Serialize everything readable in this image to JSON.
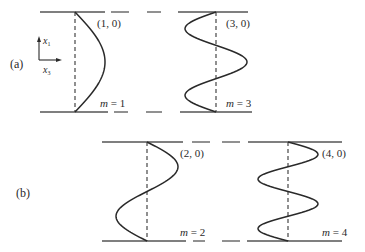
{
  "figure": {
    "colors": {
      "ink": "#2a2a2a",
      "line": "#555555"
    },
    "axes": {
      "vertical_label": "x",
      "vertical_sub": "1",
      "horizontal_label": "x",
      "horizontal_sub": "3"
    },
    "panels": [
      {
        "label": "(a)",
        "modes": [
          {
            "coord": "(1, 0)",
            "m_label": "m",
            "m_eq": " = 1",
            "m": 1
          },
          {
            "coord": "(3, 0)",
            "m_label": "m",
            "m_eq": " = 3",
            "m": 3
          }
        ]
      },
      {
        "label": "(b)",
        "modes": [
          {
            "coord": "(2, 0)",
            "m_label": "m",
            "m_eq": " = 2",
            "m": 2
          },
          {
            "coord": "(4, 0)",
            "m_label": "m",
            "m_eq": " = 4",
            "m": 4
          }
        ]
      }
    ]
  }
}
